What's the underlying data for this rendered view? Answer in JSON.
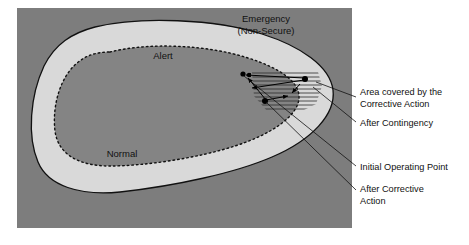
{
  "figure": {
    "colors": {
      "panel_background": "#7d7d7d",
      "emergency_region": "#7d7d7d",
      "alert_region": "#d9d9d9",
      "normal_region": "#848484",
      "page_background": "#ffffff",
      "outline": "#111111",
      "text": "#111111",
      "hatch": "#333333"
    },
    "regions": [
      {
        "id": "emergency",
        "label_line1": "Emergency",
        "label_line2": "(Non-Secure)",
        "boundary": "solid"
      },
      {
        "id": "alert",
        "label": "Alert",
        "boundary": "solid"
      },
      {
        "id": "normal",
        "label": "Normal",
        "boundary": "dotted"
      }
    ],
    "annotations": [
      {
        "id": "area-covered",
        "line1": "Area covered by the",
        "line2": "Corrective Action"
      },
      {
        "id": "after-contingency",
        "line1": "After Contingency",
        "line2": ""
      },
      {
        "id": "initial-operating-point",
        "line1": "Initial Operating Point",
        "line2": ""
      },
      {
        "id": "after-corrective-action",
        "line1": "After Corrective",
        "line2": "Action"
      }
    ],
    "markers": [
      {
        "id": "initial-operating-point-dot"
      },
      {
        "id": "after-contingency-dot"
      },
      {
        "id": "after-corrective-action-dot"
      },
      {
        "id": "hatched-area-dot"
      }
    ]
  }
}
